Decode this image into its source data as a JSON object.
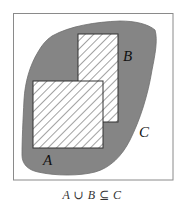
{
  "diagram": {
    "type": "venn-subset",
    "frame": {
      "x": 13,
      "y": 13,
      "width": 160,
      "height": 167,
      "stroke": "#8a8a8a"
    },
    "colors": {
      "blob_fill": "#858585",
      "blob_stroke": "#6e6e6e",
      "rect_fill": "#ffffff",
      "hatch": "#555555",
      "background": "#ffffff"
    },
    "sets": [
      {
        "id": "C",
        "label": "C",
        "shape": "blob",
        "label_pos": {
          "x": 138,
          "y": 136
        }
      },
      {
        "id": "B",
        "label": "B",
        "shape": "rect",
        "rect": {
          "x": 78,
          "y": 34,
          "width": 40,
          "height": 88
        },
        "hatched": true,
        "label_pos": {
          "x": 124,
          "y": 61
        }
      },
      {
        "id": "A",
        "label": "A",
        "shape": "rect",
        "rect": {
          "x": 33,
          "y": 81,
          "width": 70,
          "height": 67
        },
        "hatched": true,
        "label_pos": {
          "x": 43,
          "y": 165
        }
      }
    ],
    "caption": "A ∪ B ⊆ C"
  }
}
